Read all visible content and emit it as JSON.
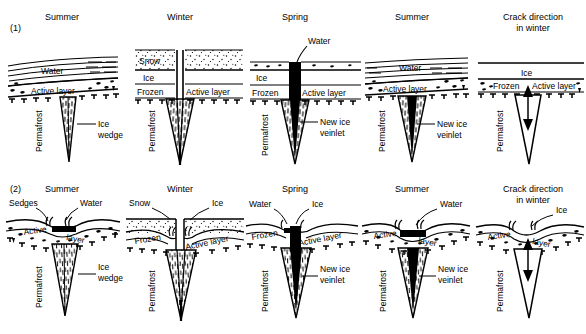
{
  "figure": {
    "rows": [
      {
        "tag": "(1)",
        "kind": "flat-surface",
        "panels": [
          {
            "title": "Summer",
            "layers": [
              "Water",
              "Active layer",
              "Permafrost"
            ],
            "callouts": [
              "Ice wedge"
            ],
            "wedge": "ice-wedge-hatched",
            "surface_labels": [
              "Water",
              "Active layer"
            ],
            "vertical_label": "Permafrost"
          },
          {
            "title": "Winter",
            "layers": [
              "Snow",
              "Ice",
              "Frozen",
              "Active layer",
              "Permafrost"
            ],
            "callouts": [],
            "wedge": "ice-wedge-hatched-cracked",
            "surface_labels": [
              "Snow",
              "Ice",
              "Frozen",
              "Active layer"
            ],
            "vertical_label": "Permafrost"
          },
          {
            "title": "Spring",
            "layers": [
              "Ice",
              "Frozen",
              "Active layer",
              "Permafrost"
            ],
            "callouts": [
              "Water",
              "New ice veinlet"
            ],
            "wedge": "ice-wedge-with-black-veinlet",
            "surface_labels": [
              "Ice",
              "Frozen",
              "Active layer"
            ],
            "vertical_label": "Permafrost"
          },
          {
            "title": "Summer",
            "layers": [
              "Water",
              "Active layer",
              "Permafrost"
            ],
            "callouts": [
              "New ice veinlet"
            ],
            "wedge": "ice-wedge-with-black-veinlet",
            "surface_labels": [
              "Water",
              "Active layer"
            ],
            "vertical_label": "Permafrost"
          },
          {
            "title": "Crack direction in winter",
            "title_line1": "Crack direction",
            "title_line2": "in winter",
            "layers": [
              "Ice",
              "Frozen",
              "Active layer",
              "Permafrost"
            ],
            "callouts": [],
            "wedge": "outline-wedge-with-arrows",
            "surface_labels": [
              "Ice",
              "Frozen",
              "Active layer"
            ],
            "vertical_label": "Permafrost"
          }
        ]
      },
      {
        "tag": "(2)",
        "kind": "trough-surface",
        "panels": [
          {
            "title": "Summer",
            "callouts": [
              "Sedges",
              "Water",
              "Ice wedge"
            ],
            "wedge": "ice-wedge-hatched",
            "surface_labels": [
              "Active",
              "layer"
            ],
            "vertical_label": "Permafrost"
          },
          {
            "title": "Winter",
            "callouts": [
              "Snow",
              "Ice"
            ],
            "wedge": "ice-wedge-hatched-cracked",
            "surface_labels": [
              "Frozen",
              "Active layer"
            ],
            "vertical_label": "Permafrost"
          },
          {
            "title": "Spring",
            "callouts": [
              "Water",
              "Ice",
              "New ice veinlet"
            ],
            "wedge": "ice-wedge-with-black-veinlet",
            "surface_labels": [
              "Frozen",
              "Active layer"
            ],
            "vertical_label": "Permafrost"
          },
          {
            "title": "Summer",
            "callouts": [
              "Water",
              "New ice veinlet"
            ],
            "wedge": "ice-wedge-with-black-veinlet",
            "surface_labels": [
              "Active",
              "layer"
            ],
            "vertical_label": "Permafrost"
          },
          {
            "title": "Crack direction in winter",
            "title_line1": "Crack direction",
            "title_line2": "in winter",
            "callouts": [
              "Ice"
            ],
            "wedge": "outline-wedge-with-arrows",
            "surface_labels": [
              "Active",
              "layer"
            ],
            "vertical_label": "Permafrost"
          }
        ]
      }
    ]
  },
  "text": {
    "row1_tag": "(1)",
    "row2_tag": "(2)",
    "summer": "Summer",
    "winter": "Winter",
    "spring": "Spring",
    "crack_l1": "Crack direction",
    "crack_l2": "in winter",
    "water": "Water",
    "ice": "Ice",
    "snow": "Snow",
    "frozen": "Frozen",
    "active_layer": "Active layer",
    "active": "Active",
    "layer": "layer",
    "permafrost": "Permafrost",
    "ice_wedge_l1": "Ice",
    "ice_wedge_l2": "wedge",
    "veinlet_l1": "New ice",
    "veinlet_l2": "veinlet",
    "sedges": "Sedges"
  },
  "colors": {
    "ink": "#000000",
    "background": "#ffffff",
    "wedge_fill": "#ffffff",
    "veinlet_fill": "#000000",
    "snow_stipple": "#000000"
  }
}
